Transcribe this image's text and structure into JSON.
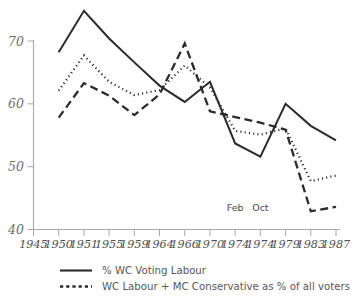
{
  "chart_data": {
    "type": "line",
    "title": "",
    "subtitle": "",
    "xlabel": "",
    "ylabel": "",
    "ylim": [
      40,
      75
    ],
    "y_ticks": [
      40,
      50,
      60,
      70
    ],
    "y_tick_labels": [
      "40",
      "50",
      "60",
      "70"
    ],
    "grid": false,
    "legend_position": "bottom",
    "categories": [
      "1945",
      "1950",
      "1951",
      "1955",
      "1959",
      "1964",
      "1966",
      "1970",
      "1974",
      "1974",
      "1979",
      "1983",
      "1987"
    ],
    "x_tick_labels": [
      "1945",
      "1950",
      "1951",
      "1955",
      "1959",
      "1964",
      "1966",
      "1970",
      "1974",
      "1974",
      "1979",
      "1983",
      "1987"
    ],
    "annotations": [
      {
        "text": "Feb",
        "x_category": "1974",
        "index": 8,
        "value": 43.0
      },
      {
        "text": "Oct",
        "x_category": "1974",
        "index": 9,
        "value": 43.0
      }
    ],
    "series": [
      {
        "name": "% WC Voting Labour",
        "style": "solid",
        "color": "#2b2b2b",
        "values": [
          null,
          68.2,
          74.8,
          70.4,
          66.6,
          62.9,
          60.3,
          63.5,
          53.7,
          51.6,
          60.0,
          56.5,
          54.2
        ]
      },
      {
        "name": "WC Labour + MC Conservative as % of all voters",
        "style": "dotted",
        "color": "#2b2b2b",
        "values": [
          null,
          62.1,
          67.7,
          63.5,
          61.4,
          62.2,
          66.1,
          62.6,
          55.7,
          55.1,
          56.1,
          47.7,
          48.6
        ]
      },
      {
        "name": "",
        "style": "dashed",
        "color": "#2b2b2b",
        "values": [
          null,
          57.8,
          63.3,
          61.3,
          58.2,
          61.5,
          69.6,
          58.8,
          57.9,
          57.0,
          55.9,
          42.9,
          43.6
        ]
      }
    ]
  },
  "legend": {
    "items": [
      {
        "label": "% WC Voting Labour",
        "style": "solid"
      },
      {
        "label": "WC Labour + MC Conservative as % of all voters",
        "style": "dotted"
      }
    ]
  }
}
